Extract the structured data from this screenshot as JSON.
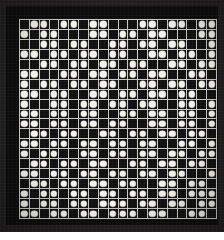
{
  "artifact": {
    "kind": "dot-matrix-grid",
    "title": "Dot matrix pattern",
    "rows": 20,
    "columns": 20,
    "on_symbol": "filled-circle",
    "off_symbol": "empty-cell"
  },
  "colors": {
    "outer_mat": "#211f1f",
    "frame": "#0d0c0c",
    "gridline": "#c9c9c4",
    "cell_background": "#111010",
    "dot": "#f2f1ec"
  },
  "grid": {
    "legend": "1 = white dot present, 0 = empty dark cell",
    "matrix": [
      [
        0,
        1,
        1,
        0,
        1,
        1,
        0,
        1,
        1,
        0,
        0,
        0,
        1,
        1,
        0,
        1,
        1,
        0,
        1,
        1
      ],
      [
        1,
        0,
        1,
        1,
        0,
        0,
        0,
        1,
        1,
        0,
        1,
        1,
        0,
        1,
        1,
        0,
        0,
        0,
        1,
        1
      ],
      [
        0,
        0,
        1,
        1,
        0,
        1,
        1,
        0,
        0,
        1,
        1,
        0,
        1,
        1,
        0,
        1,
        1,
        0,
        0,
        1
      ],
      [
        1,
        1,
        0,
        1,
        1,
        0,
        1,
        1,
        0,
        1,
        1,
        0,
        0,
        1,
        1,
        0,
        1,
        1,
        0,
        1
      ],
      [
        0,
        0,
        1,
        1,
        0,
        1,
        1,
        0,
        1,
        1,
        0,
        1,
        1,
        0,
        0,
        1,
        1,
        0,
        1,
        1
      ],
      [
        1,
        1,
        0,
        0,
        1,
        1,
        0,
        1,
        1,
        0,
        1,
        1,
        0,
        1,
        1,
        0,
        0,
        1,
        1,
        0
      ],
      [
        1,
        0,
        1,
        1,
        0,
        1,
        1,
        0,
        1,
        1,
        0,
        0,
        1,
        1,
        0,
        1,
        1,
        0,
        1,
        1
      ],
      [
        1,
        1,
        0,
        1,
        1,
        0,
        0,
        1,
        1,
        0,
        1,
        1,
        0,
        1,
        1,
        0,
        1,
        1,
        0,
        0
      ],
      [
        1,
        0,
        0,
        1,
        1,
        0,
        1,
        1,
        0,
        1,
        1,
        0,
        1,
        1,
        0,
        0,
        1,
        1,
        0,
        1
      ],
      [
        1,
        1,
        0,
        1,
        1,
        0,
        1,
        1,
        0,
        0,
        1,
        1,
        0,
        1,
        1,
        0,
        1,
        1,
        0,
        1
      ],
      [
        1,
        1,
        0,
        1,
        1,
        0,
        1,
        1,
        0,
        1,
        1,
        0,
        0,
        1,
        1,
        0,
        1,
        1,
        0,
        1
      ],
      [
        0,
        1,
        1,
        0,
        1,
        1,
        0,
        0,
        1,
        1,
        0,
        1,
        1,
        0,
        1,
        1,
        0,
        1,
        1,
        0
      ],
      [
        1,
        1,
        0,
        1,
        1,
        0,
        1,
        1,
        0,
        1,
        1,
        0,
        1,
        1,
        0,
        0,
        1,
        1,
        0,
        1
      ],
      [
        1,
        0,
        1,
        1,
        0,
        0,
        1,
        1,
        0,
        1,
        1,
        0,
        1,
        1,
        0,
        1,
        1,
        0,
        1,
        1
      ],
      [
        0,
        1,
        1,
        0,
        1,
        1,
        0,
        1,
        1,
        0,
        0,
        1,
        1,
        0,
        1,
        1,
        0,
        1,
        1,
        0
      ],
      [
        1,
        1,
        0,
        1,
        1,
        0,
        1,
        1,
        0,
        1,
        1,
        0,
        1,
        1,
        0,
        1,
        1,
        0,
        0,
        1
      ],
      [
        0,
        1,
        1,
        0,
        1,
        1,
        0,
        1,
        1,
        0,
        1,
        1,
        0,
        0,
        1,
        1,
        0,
        1,
        1,
        0
      ],
      [
        1,
        0,
        1,
        1,
        0,
        1,
        1,
        0,
        1,
        1,
        0,
        1,
        1,
        0,
        1,
        1,
        0,
        1,
        1,
        1
      ],
      [
        1,
        0,
        1,
        1,
        0,
        1,
        1,
        0,
        1,
        1,
        1,
        0,
        1,
        1,
        0,
        1,
        1,
        0,
        1,
        1
      ],
      [
        1,
        1,
        0,
        1,
        1,
        0,
        1,
        1,
        0,
        1,
        1,
        1,
        0,
        1,
        1,
        0,
        0,
        1,
        1,
        0
      ]
    ]
  }
}
